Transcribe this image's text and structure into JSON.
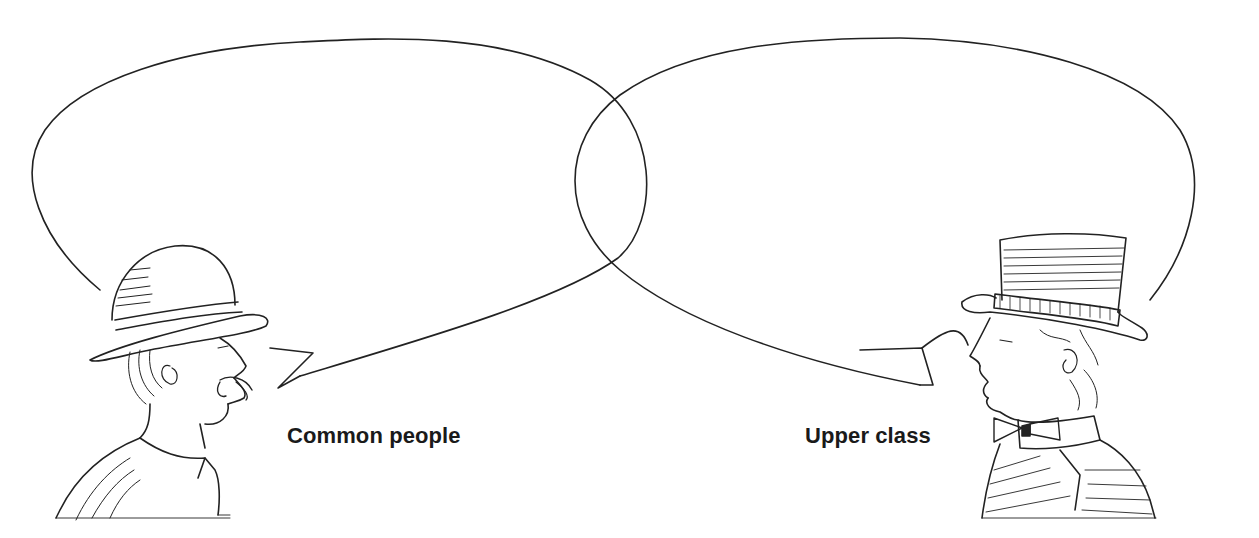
{
  "figures": [
    {
      "id": "left",
      "label": "Common people",
      "headwear": "bowler-hat",
      "features": [
        "mustache",
        "open-collar-shirt",
        "coat"
      ],
      "facing": "right"
    },
    {
      "id": "right",
      "label": "Upper class",
      "headwear": "top-hat",
      "features": [
        "bow-tie",
        "high-collar",
        "striped-coat"
      ],
      "facing": "left"
    }
  ],
  "speech_bubbles": [
    {
      "id": "left-bubble",
      "owner": "left",
      "text": ""
    },
    {
      "id": "right-bubble",
      "owner": "right",
      "text": ""
    }
  ],
  "colors": {
    "background": "#ffffff",
    "line": "#222222",
    "text": "#1a1a1a"
  }
}
